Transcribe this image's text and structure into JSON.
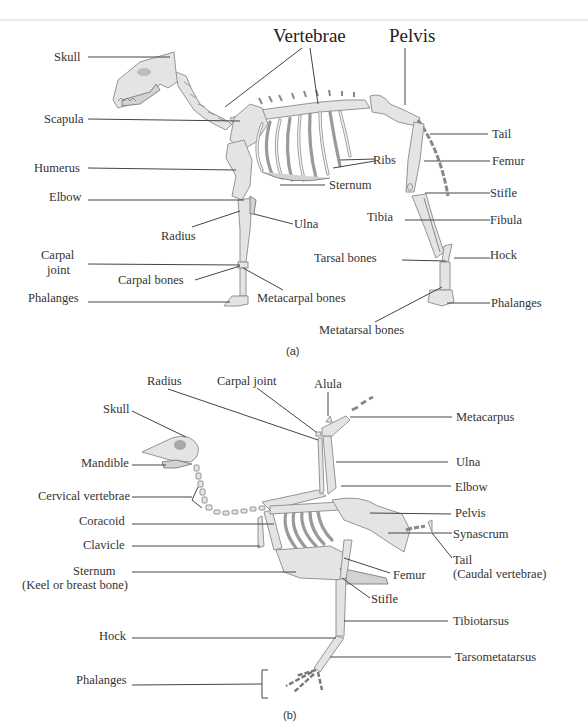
{
  "figure_a": {
    "caption": "(a)",
    "labels": {
      "skull": "Skull",
      "vertebrae": "Vertebrae",
      "pelvis": "Pelvis",
      "scapula": "Scapula",
      "tail": "Tail",
      "humerus": "Humerus",
      "ribs": "Ribs",
      "femur": "Femur",
      "sternum": "Sternum",
      "elbow": "Elbow",
      "stifle": "Stifle",
      "radius": "Radius",
      "ulna": "Ulna",
      "tibia": "Tibia",
      "fibula": "Fibula",
      "carpal_joint_1": "Carpal",
      "carpal_joint_2": "joint",
      "tarsal_bones": "Tarsal bones",
      "hock": "Hock",
      "carpal_bones": "Carpal bones",
      "metacarpal_bones": "Metacarpal bones",
      "phalanges_front": "Phalanges",
      "phalanges_hind": "Phalanges",
      "metatarsal_bones": "Metatarsal bones"
    }
  },
  "figure_b": {
    "caption": "(b)",
    "labels": {
      "radius": "Radius",
      "carpal_joint": "Carpal joint",
      "alula": "Alula",
      "skull": "Skull",
      "metacarpus": "Metacarpus",
      "mandible": "Mandible",
      "ulna": "Ulna",
      "cervical_vertebrae": "Cervical vertebrae",
      "elbow": "Elbow",
      "coracoid": "Coracoid",
      "pelvis": "Pelvis",
      "synascrum": "Synascrum",
      "clavicle": "Clavicle",
      "tail_1": "Tail",
      "tail_2": "(Caudal vertebrae)",
      "sternum_1": "Sternum",
      "sternum_2": "(Keel or breast bone)",
      "femur": "Femur",
      "stifle": "Stifle",
      "tibiotarsus": "Tibiotarsus",
      "hock": "Hock",
      "tarsometatarsus": "Tarsometatarsus",
      "phalanges": "Phalanges"
    }
  }
}
